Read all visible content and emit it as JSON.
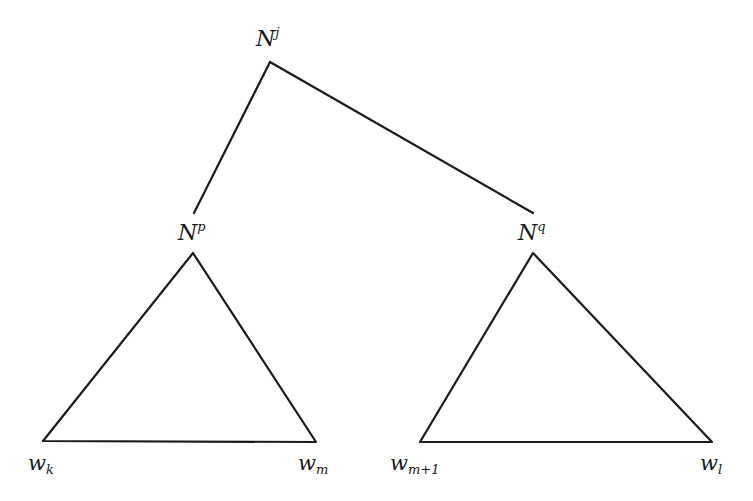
{
  "diagram": {
    "type": "parse-tree",
    "root": {
      "base": "N",
      "sup": "j"
    },
    "children": [
      {
        "base": "N",
        "sup": "p",
        "span": {
          "left": {
            "base": "w",
            "sub": "k"
          },
          "right": {
            "base": "w",
            "sub": "m"
          }
        }
      },
      {
        "base": "N",
        "sup": "q",
        "span": {
          "left": {
            "base": "w",
            "sub": "m+1"
          },
          "right": {
            "base": "w",
            "sub": "l"
          }
        }
      }
    ],
    "stroke_color": "#1a1a1a",
    "background": "#ffffff"
  }
}
